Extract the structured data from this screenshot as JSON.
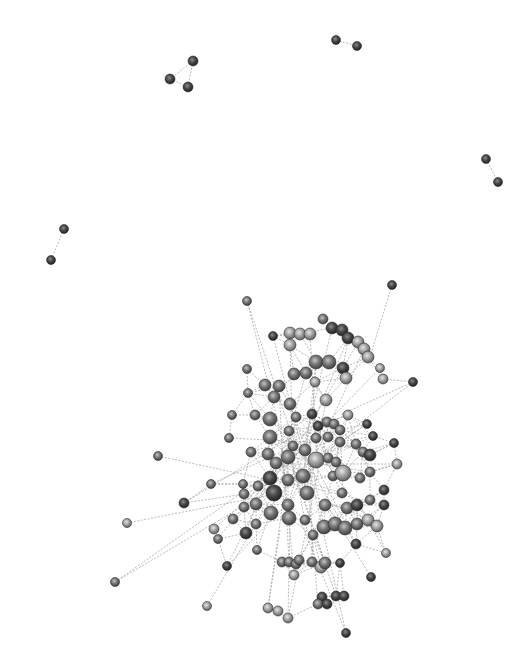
{
  "diagram": {
    "type": "network-graph",
    "width": 532,
    "height": 670,
    "background": "#ffffff",
    "colors": {
      "dark": "#3a3a3a",
      "mid": "#6e6e6e",
      "light": "#9a9a9a",
      "edge": "#9a9a9a"
    },
    "components": [
      {
        "name": "triad-top-left",
        "nodes": [
          {
            "id": "a1",
            "x": 193,
            "y": 61,
            "r": 5,
            "tone": "dark"
          },
          {
            "id": "a2",
            "x": 170,
            "y": 79,
            "r": 5,
            "tone": "dark"
          },
          {
            "id": "a3",
            "x": 188,
            "y": 87,
            "r": 5,
            "tone": "dark"
          }
        ],
        "edges": [
          [
            "a1",
            "a2"
          ],
          [
            "a2",
            "a3"
          ],
          [
            "a1",
            "a3"
          ]
        ]
      },
      {
        "name": "pair-top",
        "nodes": [
          {
            "id": "b1",
            "x": 336,
            "y": 40,
            "r": 4.5,
            "tone": "dark"
          },
          {
            "id": "b2",
            "x": 357,
            "y": 46,
            "r": 4.5,
            "tone": "dark"
          }
        ],
        "edges": [
          [
            "b1",
            "b2"
          ]
        ]
      },
      {
        "name": "pair-right",
        "nodes": [
          {
            "id": "c1",
            "x": 486,
            "y": 159,
            "r": 4.5,
            "tone": "dark"
          },
          {
            "id": "c2",
            "x": 498,
            "y": 182,
            "r": 4.5,
            "tone": "dark"
          }
        ],
        "edges": [
          [
            "c1",
            "c2"
          ]
        ]
      },
      {
        "name": "pair-left",
        "nodes": [
          {
            "id": "d1",
            "x": 64,
            "y": 229,
            "r": 4.5,
            "tone": "dark"
          },
          {
            "id": "d2",
            "x": 51,
            "y": 260,
            "r": 4.5,
            "tone": "dark"
          }
        ],
        "edges": [
          [
            "d1",
            "d2"
          ]
        ]
      }
    ],
    "main_cluster": {
      "name": "giant-component",
      "hub_nodes": [
        {
          "x": 247,
          "y": 301,
          "r": 4.5,
          "tone": "mid"
        },
        {
          "x": 392,
          "y": 285,
          "r": 4.5,
          "tone": "dark"
        },
        {
          "x": 273,
          "y": 336,
          "r": 4.5,
          "tone": "dark"
        },
        {
          "x": 323,
          "y": 319,
          "r": 5,
          "tone": "mid"
        },
        {
          "x": 290,
          "y": 333,
          "r": 6,
          "tone": "light"
        },
        {
          "x": 300,
          "y": 334,
          "r": 6,
          "tone": "light"
        },
        {
          "x": 310,
          "y": 334,
          "r": 6,
          "tone": "light"
        },
        {
          "x": 290,
          "y": 345,
          "r": 6,
          "tone": "light"
        },
        {
          "x": 332,
          "y": 328,
          "r": 6,
          "tone": "dark"
        },
        {
          "x": 342,
          "y": 330,
          "r": 6,
          "tone": "dark"
        },
        {
          "x": 348,
          "y": 338,
          "r": 6,
          "tone": "dark"
        },
        {
          "x": 358,
          "y": 342,
          "r": 6,
          "tone": "light"
        },
        {
          "x": 364,
          "y": 349,
          "r": 6,
          "tone": "light"
        },
        {
          "x": 368,
          "y": 357,
          "r": 6,
          "tone": "light"
        },
        {
          "x": 316,
          "y": 362,
          "r": 7,
          "tone": "mid"
        },
        {
          "x": 329,
          "y": 362,
          "r": 7,
          "tone": "mid"
        },
        {
          "x": 343,
          "y": 368,
          "r": 6,
          "tone": "dark"
        },
        {
          "x": 346,
          "y": 378,
          "r": 6,
          "tone": "light"
        },
        {
          "x": 380,
          "y": 368,
          "r": 4.5,
          "tone": "light"
        },
        {
          "x": 383,
          "y": 379,
          "r": 5,
          "tone": "light"
        },
        {
          "x": 413,
          "y": 382,
          "r": 4.5,
          "tone": "dark"
        },
        {
          "x": 294,
          "y": 374,
          "r": 6,
          "tone": "mid"
        },
        {
          "x": 306,
          "y": 373,
          "r": 6,
          "tone": "mid"
        },
        {
          "x": 315,
          "y": 382,
          "r": 5,
          "tone": "light"
        },
        {
          "x": 326,
          "y": 400,
          "r": 6,
          "tone": "light"
        },
        {
          "x": 247,
          "y": 369,
          "r": 4.5,
          "tone": "mid"
        },
        {
          "x": 248,
          "y": 393,
          "r": 4.5,
          "tone": "mid"
        },
        {
          "x": 265,
          "y": 385,
          "r": 6,
          "tone": "mid"
        },
        {
          "x": 279,
          "y": 386,
          "r": 6,
          "tone": "mid"
        },
        {
          "x": 274,
          "y": 397,
          "r": 6,
          "tone": "mid"
        },
        {
          "x": 290,
          "y": 404,
          "r": 6,
          "tone": "mid"
        },
        {
          "x": 232,
          "y": 415,
          "r": 4.5,
          "tone": "mid"
        },
        {
          "x": 255,
          "y": 415,
          "r": 5,
          "tone": "mid"
        },
        {
          "x": 270,
          "y": 419,
          "r": 7,
          "tone": "mid"
        },
        {
          "x": 296,
          "y": 417,
          "r": 5,
          "tone": "mid"
        },
        {
          "x": 312,
          "y": 414,
          "r": 5,
          "tone": "dark"
        },
        {
          "x": 229,
          "y": 438,
          "r": 4.5,
          "tone": "mid"
        },
        {
          "x": 270,
          "y": 437,
          "r": 7,
          "tone": "mid"
        },
        {
          "x": 289,
          "y": 431,
          "r": 5,
          "tone": "mid"
        },
        {
          "x": 293,
          "y": 446,
          "r": 5,
          "tone": "mid"
        },
        {
          "x": 318,
          "y": 426,
          "r": 5,
          "tone": "dark"
        },
        {
          "x": 327,
          "y": 422,
          "r": 5,
          "tone": "mid"
        },
        {
          "x": 334,
          "y": 424,
          "r": 5,
          "tone": "mid"
        },
        {
          "x": 340,
          "y": 430,
          "r": 5,
          "tone": "mid"
        },
        {
          "x": 316,
          "y": 438,
          "r": 5,
          "tone": "mid"
        },
        {
          "x": 328,
          "y": 437,
          "r": 5,
          "tone": "mid"
        },
        {
          "x": 340,
          "y": 442,
          "r": 5,
          "tone": "mid"
        },
        {
          "x": 348,
          "y": 415,
          "r": 5,
          "tone": "light"
        },
        {
          "x": 367,
          "y": 424,
          "r": 4.5,
          "tone": "dark"
        },
        {
          "x": 394,
          "y": 443,
          "r": 4.5,
          "tone": "dark"
        },
        {
          "x": 251,
          "y": 452,
          "r": 5,
          "tone": "mid"
        },
        {
          "x": 268,
          "y": 454,
          "r": 6,
          "tone": "mid"
        },
        {
          "x": 276,
          "y": 463,
          "r": 6,
          "tone": "mid"
        },
        {
          "x": 288,
          "y": 457,
          "r": 7,
          "tone": "mid"
        },
        {
          "x": 305,
          "y": 450,
          "r": 6,
          "tone": "mid"
        },
        {
          "x": 316,
          "y": 460,
          "r": 8,
          "tone": "light"
        },
        {
          "x": 328,
          "y": 458,
          "r": 5,
          "tone": "mid"
        },
        {
          "x": 336,
          "y": 462,
          "r": 5,
          "tone": "mid"
        },
        {
          "x": 356,
          "y": 444,
          "r": 5,
          "tone": "mid"
        },
        {
          "x": 363,
          "y": 452,
          "r": 5,
          "tone": "mid"
        },
        {
          "x": 370,
          "y": 455,
          "r": 6,
          "tone": "dark"
        },
        {
          "x": 373,
          "y": 436,
          "r": 4.5,
          "tone": "dark"
        },
        {
          "x": 397,
          "y": 464,
          "r": 5,
          "tone": "light"
        },
        {
          "x": 158,
          "y": 456,
          "r": 4.5,
          "tone": "mid"
        },
        {
          "x": 211,
          "y": 484,
          "r": 4.5,
          "tone": "mid"
        },
        {
          "x": 243,
          "y": 484,
          "r": 4.5,
          "tone": "mid"
        },
        {
          "x": 244,
          "y": 494,
          "r": 5,
          "tone": "mid"
        },
        {
          "x": 258,
          "y": 486,
          "r": 5,
          "tone": "mid"
        },
        {
          "x": 270,
          "y": 478,
          "r": 7,
          "tone": "dark"
        },
        {
          "x": 274,
          "y": 493,
          "r": 8,
          "tone": "dark"
        },
        {
          "x": 288,
          "y": 480,
          "r": 6,
          "tone": "mid"
        },
        {
          "x": 303,
          "y": 476,
          "r": 7,
          "tone": "mid"
        },
        {
          "x": 307,
          "y": 493,
          "r": 7,
          "tone": "mid"
        },
        {
          "x": 333,
          "y": 476,
          "r": 5,
          "tone": "mid"
        },
        {
          "x": 343,
          "y": 473,
          "r": 8,
          "tone": "light"
        },
        {
          "x": 360,
          "y": 478,
          "r": 5,
          "tone": "mid"
        },
        {
          "x": 370,
          "y": 472,
          "r": 5,
          "tone": "mid"
        },
        {
          "x": 384,
          "y": 490,
          "r": 5,
          "tone": "dark"
        },
        {
          "x": 184,
          "y": 503,
          "r": 5,
          "tone": "dark"
        },
        {
          "x": 244,
          "y": 507,
          "r": 5,
          "tone": "mid"
        },
        {
          "x": 256,
          "y": 504,
          "r": 6,
          "tone": "mid"
        },
        {
          "x": 271,
          "y": 513,
          "r": 7,
          "tone": "mid"
        },
        {
          "x": 288,
          "y": 505,
          "r": 6,
          "tone": "mid"
        },
        {
          "x": 325,
          "y": 505,
          "r": 6,
          "tone": "mid"
        },
        {
          "x": 342,
          "y": 493,
          "r": 5,
          "tone": "mid"
        },
        {
          "x": 347,
          "y": 508,
          "r": 6,
          "tone": "mid"
        },
        {
          "x": 357,
          "y": 505,
          "r": 6,
          "tone": "dark"
        },
        {
          "x": 370,
          "y": 500,
          "r": 5,
          "tone": "mid"
        },
        {
          "x": 384,
          "y": 505,
          "r": 5,
          "tone": "dark"
        },
        {
          "x": 127,
          "y": 523,
          "r": 4.5,
          "tone": "light"
        },
        {
          "x": 214,
          "y": 529,
          "r": 5,
          "tone": "light"
        },
        {
          "x": 218,
          "y": 539,
          "r": 4.5,
          "tone": "mid"
        },
        {
          "x": 233,
          "y": 519,
          "r": 5,
          "tone": "mid"
        },
        {
          "x": 246,
          "y": 533,
          "r": 6,
          "tone": "dark"
        },
        {
          "x": 256,
          "y": 524,
          "r": 5,
          "tone": "mid"
        },
        {
          "x": 289,
          "y": 518,
          "r": 7,
          "tone": "mid"
        },
        {
          "x": 305,
          "y": 520,
          "r": 5,
          "tone": "mid"
        },
        {
          "x": 313,
          "y": 535,
          "r": 5,
          "tone": "mid"
        },
        {
          "x": 324,
          "y": 527,
          "r": 7,
          "tone": "mid"
        },
        {
          "x": 335,
          "y": 524,
          "r": 7,
          "tone": "mid"
        },
        {
          "x": 345,
          "y": 528,
          "r": 7,
          "tone": "mid"
        },
        {
          "x": 357,
          "y": 524,
          "r": 6,
          "tone": "mid"
        },
        {
          "x": 368,
          "y": 520,
          "r": 6,
          "tone": "light"
        },
        {
          "x": 377,
          "y": 526,
          "r": 6,
          "tone": "light"
        },
        {
          "x": 356,
          "y": 544,
          "r": 5,
          "tone": "dark"
        },
        {
          "x": 386,
          "y": 553,
          "r": 4.5,
          "tone": "light"
        },
        {
          "x": 257,
          "y": 550,
          "r": 4.5,
          "tone": "mid"
        },
        {
          "x": 282,
          "y": 562,
          "r": 5,
          "tone": "mid"
        },
        {
          "x": 289,
          "y": 562,
          "r": 5,
          "tone": "mid"
        },
        {
          "x": 296,
          "y": 564,
          "r": 5,
          "tone": "mid"
        },
        {
          "x": 312,
          "y": 562,
          "r": 5,
          "tone": "mid"
        },
        {
          "x": 321,
          "y": 567,
          "r": 6,
          "tone": "light"
        },
        {
          "x": 325,
          "y": 563,
          "r": 6,
          "tone": "mid"
        },
        {
          "x": 340,
          "y": 563,
          "r": 4.5,
          "tone": "dark"
        },
        {
          "x": 294,
          "y": 575,
          "r": 5,
          "tone": "light"
        },
        {
          "x": 299,
          "y": 560,
          "r": 5,
          "tone": "mid"
        },
        {
          "x": 227,
          "y": 566,
          "r": 4.5,
          "tone": "dark"
        },
        {
          "x": 371,
          "y": 577,
          "r": 4.5,
          "tone": "dark"
        },
        {
          "x": 115,
          "y": 582,
          "r": 4.5,
          "tone": "mid"
        },
        {
          "x": 322,
          "y": 597,
          "r": 5,
          "tone": "dark"
        },
        {
          "x": 336,
          "y": 596,
          "r": 5,
          "tone": "dark"
        },
        {
          "x": 344,
          "y": 596,
          "r": 5,
          "tone": "dark"
        },
        {
          "x": 318,
          "y": 604,
          "r": 5,
          "tone": "mid"
        },
        {
          "x": 327,
          "y": 604,
          "r": 5,
          "tone": "dark"
        },
        {
          "x": 268,
          "y": 608,
          "r": 5,
          "tone": "light"
        },
        {
          "x": 278,
          "y": 611,
          "r": 5,
          "tone": "light"
        },
        {
          "x": 288,
          "y": 618,
          "r": 5,
          "tone": "light"
        },
        {
          "x": 207,
          "y": 606,
          "r": 4.5,
          "tone": "light"
        },
        {
          "x": 346,
          "y": 633,
          "r": 4.5,
          "tone": "dark"
        }
      ],
      "long_edges": [
        [
          247,
          301,
          290,
          430
        ],
        [
          392,
          285,
          370,
          357
        ],
        [
          413,
          382,
          340,
          415
        ],
        [
          158,
          456,
          270,
          480
        ],
        [
          127,
          523,
          270,
          495
        ],
        [
          115,
          582,
          270,
          490
        ],
        [
          184,
          503,
          245,
          494
        ],
        [
          211,
          484,
          250,
          484
        ],
        [
          207,
          606,
          274,
          493
        ],
        [
          346,
          633,
          300,
          520
        ],
        [
          288,
          618,
          290,
          520
        ],
        [
          268,
          608,
          280,
          530
        ],
        [
          227,
          566,
          260,
          500
        ],
        [
          371,
          577,
          330,
          510
        ],
        [
          386,
          553,
          360,
          505
        ],
        [
          397,
          464,
          370,
          472
        ],
        [
          394,
          443,
          360,
          460
        ]
      ]
    }
  }
}
